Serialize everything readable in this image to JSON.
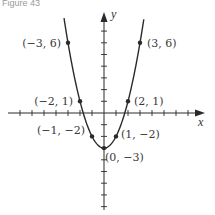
{
  "figure": {
    "caption": "Figure 43"
  },
  "chart_data": {
    "type": "line",
    "title": "",
    "function": "y = x^2 - 3",
    "xlabel": "x",
    "ylabel": "y",
    "xlim": [
      -8,
      8
    ],
    "ylim": [
      -8,
      8
    ],
    "grid": false,
    "tick_spacing": 1,
    "labeled_points": [
      {
        "x": -3,
        "y": 6,
        "label": "(−3, 6)"
      },
      {
        "x": 3,
        "y": 6,
        "label": "(3, 6)"
      },
      {
        "x": -2,
        "y": 1,
        "label": "(−2, 1)"
      },
      {
        "x": 2,
        "y": 1,
        "label": "(2, 1)"
      },
      {
        "x": -1,
        "y": -2,
        "label": "(−1, −2)"
      },
      {
        "x": 1,
        "y": -2,
        "label": "(1, −2)"
      },
      {
        "x": 0,
        "y": -3,
        "label": "(0, −3)"
      }
    ],
    "colors": {
      "curve": "#2a2a2a",
      "axes": "#2a2a2a",
      "text": "#3a3a3a"
    }
  }
}
